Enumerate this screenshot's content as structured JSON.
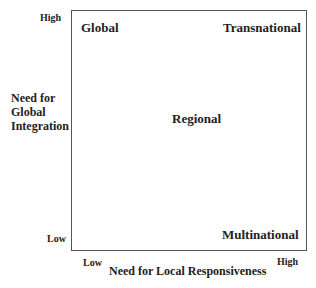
{
  "diagram": {
    "y_axis": {
      "title_lines": [
        "Need for",
        "Global",
        "Integration"
      ],
      "high": "High",
      "low": "Low"
    },
    "x_axis": {
      "title": "Need for Local Responsiveness",
      "low": "Low",
      "high": "High"
    },
    "quadrants": {
      "top_left": "Global",
      "top_right": "Transnational",
      "center": "Regional",
      "bottom_right": "Multinational"
    }
  }
}
